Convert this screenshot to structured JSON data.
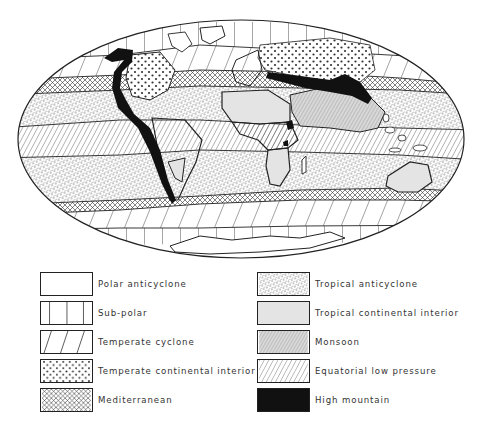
{
  "map": {
    "projection": "world-elliptical",
    "title": ""
  },
  "legend": {
    "items": [
      {
        "id": "polar-anticyclone",
        "label": "Polar anticyclone",
        "pattern": "blank"
      },
      {
        "id": "sub-polar",
        "label": "Sub-polar",
        "pattern": "vertical-lines"
      },
      {
        "id": "temperate-cyclone",
        "label": "Temperate cyclone",
        "pattern": "wide-diagonal-lines"
      },
      {
        "id": "temperate-continental-interior",
        "label": "Temperate continental interior",
        "pattern": "dots"
      },
      {
        "id": "mediterranean",
        "label": "Mediterranean",
        "pattern": "crosshatch"
      },
      {
        "id": "tropical-anticyclone",
        "label": "Tropical anticyclone",
        "pattern": "dense-short-dashes"
      },
      {
        "id": "tropical-continental-interior",
        "label": "Tropical continental interior",
        "pattern": "light-grey-fill"
      },
      {
        "id": "monsoon",
        "label": "Monsoon",
        "pattern": "dense-stipple"
      },
      {
        "id": "equatorial-low-pressure",
        "label": "Equatorial low pressure",
        "pattern": "narrow-diagonal-lines"
      },
      {
        "id": "high-mountain",
        "label": "High mountain",
        "pattern": "solid-black"
      }
    ]
  },
  "colors": {
    "ink": "#1a1a1a",
    "grey_fill": "#e4e4e4",
    "paper": "#ffffff"
  },
  "caption": ""
}
